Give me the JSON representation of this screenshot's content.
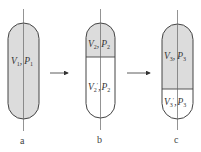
{
  "diagram": {
    "colors": {
      "fill_gray": "#dcdcdc",
      "fill_white": "#ffffff",
      "stroke": "#444444",
      "axis": "#666666"
    },
    "arrows": [
      {
        "from": "a",
        "to": "b"
      },
      {
        "from": "b",
        "to": "c"
      }
    ],
    "panels": [
      {
        "id": "a",
        "caption": "a",
        "regions": [
          {
            "fill": "gray",
            "var": "V",
            "var_sub": "1",
            "sep": ",",
            "pvar": "P",
            "pvar_sub": "1"
          }
        ]
      },
      {
        "id": "b",
        "caption": "b",
        "regions": [
          {
            "fill": "gray",
            "var": "V",
            "var_sub": "2",
            "sep": ",",
            "pvar": "P",
            "pvar_sub": "2"
          },
          {
            "fill": "white",
            "var": "V",
            "var_sub": "2",
            "prime": "′",
            "sep": ",",
            "pvar": "P",
            "pvar_sub": "2"
          }
        ]
      },
      {
        "id": "c",
        "caption": "c",
        "regions": [
          {
            "fill": "gray",
            "var": "V",
            "var_sub": "3",
            "sep": ",",
            "pvar": "P",
            "pvar_sub": "3"
          },
          {
            "fill": "white",
            "var": "V",
            "var_sub": "3",
            "prime": "′",
            "sep": ",",
            "pvar": "P",
            "pvar_sub": "3"
          }
        ]
      }
    ]
  }
}
